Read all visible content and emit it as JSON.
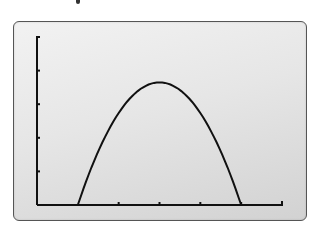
{
  "chart_data": {
    "type": "line",
    "title": "",
    "xlabel": "",
    "ylabel": "",
    "grid": false,
    "legend": null,
    "x_ticks": 5,
    "y_ticks": 5,
    "x_range": [
      0,
      6
    ],
    "y_range": [
      0,
      5
    ],
    "series": [
      {
        "name": "curve",
        "x": [
          1,
          1.5,
          2,
          2.5,
          3,
          3.5,
          4,
          4.5,
          5
        ],
        "y": [
          0,
          1.85,
          3.0,
          3.5,
          3.65,
          3.5,
          3.0,
          1.85,
          0
        ]
      }
    ],
    "colors": {
      "line": "#111111",
      "axis": "#111111",
      "frame": "#555555",
      "background": "#e4e4e4"
    }
  }
}
